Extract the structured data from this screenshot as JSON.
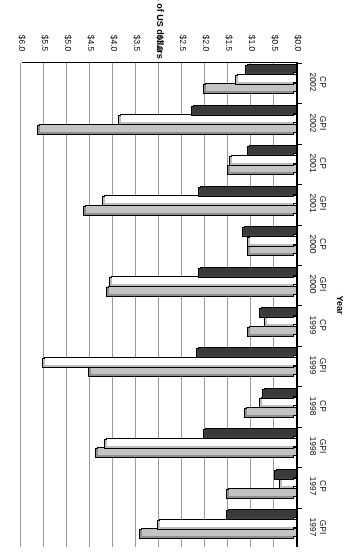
{
  "chart_data": {
    "type": "bar",
    "orientation": "horizontal",
    "title": "",
    "xlabel": "Year",
    "ylabel": "Millions of US dollars",
    "categories": [
      "GPI 1997",
      "CP 1997",
      "GPI 1998",
      "CP 1998",
      "GPI 1999",
      "CP 1999",
      "GPI 2000",
      "CP 2000",
      "GPI 2001",
      "CP 2001",
      "GPI 2002",
      "CP 2002"
    ],
    "category_lines": [
      [
        "GPI",
        "1997"
      ],
      [
        "CP",
        "1997"
      ],
      [
        "GPI",
        "1998"
      ],
      [
        "CP",
        "1998"
      ],
      [
        "GPI",
        "1999"
      ],
      [
        "CP",
        "1999"
      ],
      [
        "GPI",
        "2000"
      ],
      [
        "CP",
        "2000"
      ],
      [
        "GPI",
        "2001"
      ],
      [
        "CP",
        "2001"
      ],
      [
        "GPI",
        "2002"
      ],
      [
        "CP",
        "2002"
      ]
    ],
    "series": [
      {
        "name": "Series 1",
        "color": "#3a3a3a",
        "style": "dark",
        "values": [
          1.5,
          0.45,
          2.0,
          0.72,
          2.15,
          0.78,
          2.1,
          1.15,
          2.1,
          1.05,
          2.25,
          1.08
        ]
      },
      {
        "name": "Series 2",
        "color": "#ffffff",
        "style": "white",
        "values": [
          3.0,
          0.35,
          4.15,
          0.78,
          5.5,
          0.68,
          4.05,
          1.05,
          4.2,
          1.43,
          3.85,
          1.3
        ]
      },
      {
        "name": "Series 3",
        "color": "#c3c3c3",
        "style": "gray",
        "values": [
          3.4,
          1.5,
          4.35,
          1.1,
          4.5,
          1.05,
          4.1,
          1.05,
          4.6,
          1.48,
          5.6,
          2.0
        ]
      }
    ],
    "value_ticks": [
      "$0.0",
      "$0.5",
      "$1.0",
      "$1.5",
      "$2.0",
      "$2.5",
      "$3.0",
      "$3.5",
      "$4.0",
      "$4.5",
      "$5.0",
      "$5.5",
      "$6.0"
    ],
    "value_tick_numbers": [
      0.0,
      0.5,
      1.0,
      1.5,
      2.0,
      2.5,
      3.0,
      3.5,
      4.0,
      4.5,
      5.0,
      5.5,
      6.0
    ],
    "vlim": [
      0.0,
      6.0
    ],
    "grid": true,
    "legend": "none",
    "axis_color": "#000000",
    "grid_color": "#9a9a9a"
  }
}
